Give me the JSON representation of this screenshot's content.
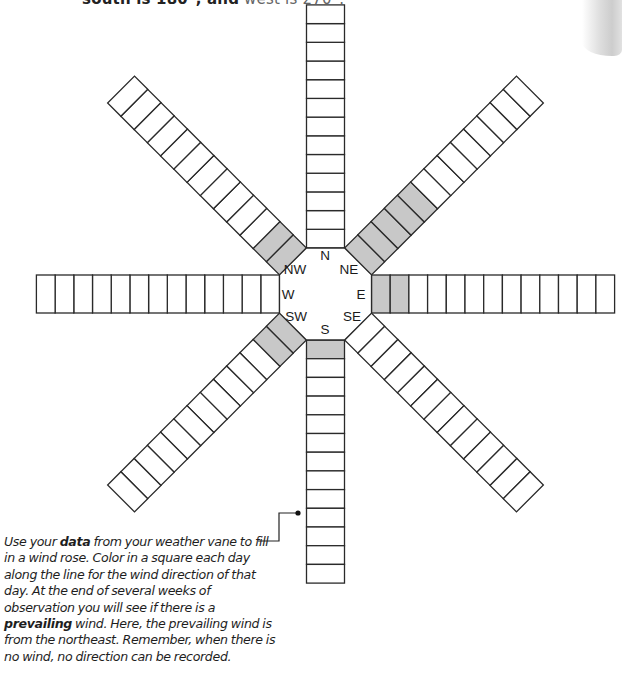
{
  "header": {
    "top_text_bold": "south is 180°, and",
    "top_text_light": " west is 270°."
  },
  "wind_rose": {
    "cells_per_direction": 13,
    "shade_color": "#c8c8c8",
    "line_color": "#2a2a2a",
    "directions": [
      {
        "label": "N",
        "angle": 0,
        "shaded": 0
      },
      {
        "label": "NE",
        "angle": 45,
        "shaded": 5
      },
      {
        "label": "E",
        "angle": 90,
        "shaded": 2
      },
      {
        "label": "SE",
        "angle": 135,
        "shaded": 0
      },
      {
        "label": "S",
        "angle": 180,
        "shaded": 1
      },
      {
        "label": "SW",
        "angle": 225,
        "shaded": 2
      },
      {
        "label": "W",
        "angle": 270,
        "shaded": 0
      },
      {
        "label": "NW",
        "angle": 315,
        "shaded": 2
      }
    ],
    "prevailing_wind": "NE"
  },
  "chart_data": {
    "type": "bar",
    "title": "Wind rose",
    "categories": [
      "N",
      "NE",
      "E",
      "SE",
      "S",
      "SW",
      "W",
      "NW"
    ],
    "values": [
      0,
      5,
      2,
      0,
      1,
      2,
      0,
      2
    ],
    "ylim": [
      0,
      13
    ],
    "xlabel": "Wind direction",
    "ylabel": "Days (colored squares)"
  },
  "caption": {
    "p1": "Use your ",
    "b1": "data",
    "p2": " from your weather vane to fill in a wind rose. Color in a square each day along the line for the wind direction of that day. At the end of several weeks of observation you will see if there is a ",
    "b2": "prevailing",
    "p3": " wind. Here, the prevailing wind is from the northeast. Remember, when there is no wind, no direction can be recorded."
  }
}
